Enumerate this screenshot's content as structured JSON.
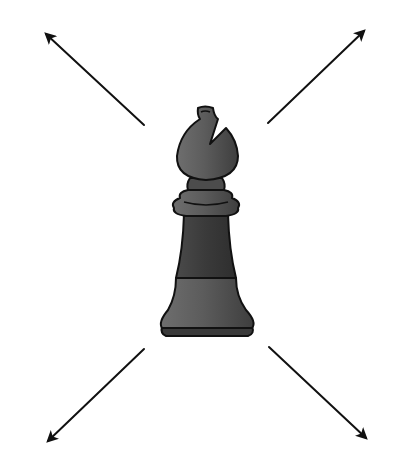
{
  "figure": {
    "piece": "bishop",
    "piece_color": "#5a5a5a",
    "outline_color": "#111111",
    "arrow_color": "#111111",
    "background": "#ffffff",
    "arrows": [
      {
        "direction": "up-left",
        "from": [
          144,
          125
        ],
        "to": [
          44,
          32
        ]
      },
      {
        "direction": "up-right",
        "from": [
          268,
          123
        ],
        "to": [
          366,
          29
        ]
      },
      {
        "direction": "down-left",
        "from": [
          144,
          349
        ],
        "to": [
          46,
          443
        ]
      },
      {
        "direction": "down-right",
        "from": [
          269,
          347
        ],
        "to": [
          368,
          440
        ]
      }
    ]
  }
}
